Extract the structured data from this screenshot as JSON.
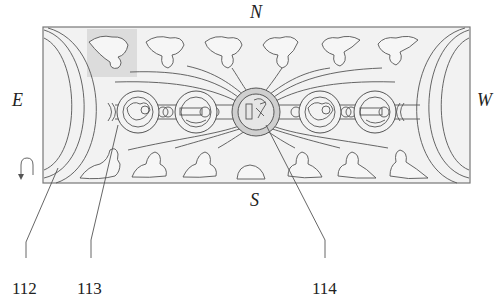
{
  "diagram": {
    "type": "plan-view patent figure",
    "compass": {
      "north": "N",
      "south": "S",
      "east": "E",
      "west": "W"
    },
    "reference_numerals": [
      {
        "id": "112",
        "label": "112",
        "target": "left end arc region"
      },
      {
        "id": "113",
        "label": "113",
        "target": "figure cluster / medallion"
      },
      {
        "id": "114",
        "label": "114",
        "target": "central medallion"
      }
    ],
    "highlight": {
      "description": "shaded square over upper-left figure",
      "color": "#d9d9d9"
    },
    "panel": {
      "background": "#f2f2f2",
      "border": "#777777"
    },
    "top_figures_count": 6,
    "bottom_figures_count": 7,
    "medallions_count": 5,
    "rotation_icon": "u-turn-arrow-down"
  }
}
